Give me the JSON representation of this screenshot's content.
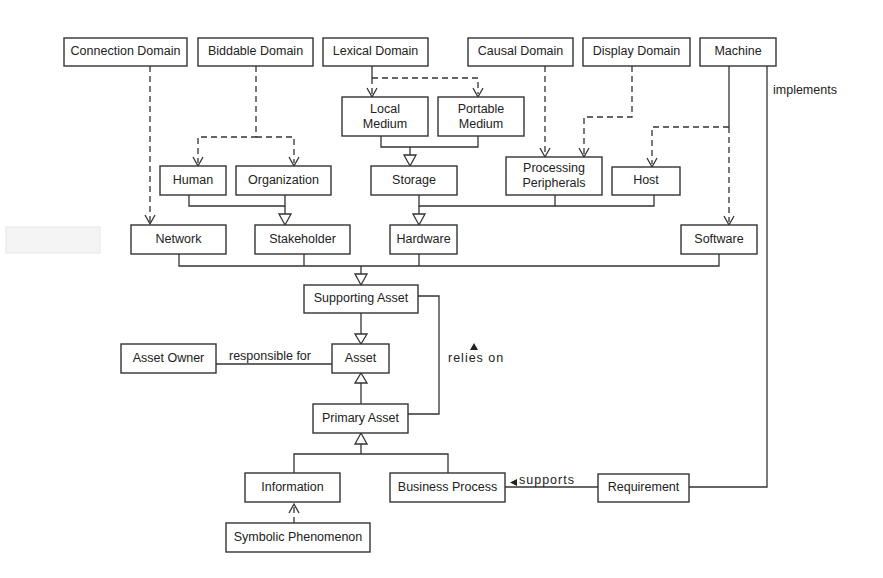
{
  "diagram": {
    "type": "class-diagram",
    "nodes": {
      "connection_domain": "Connection Domain",
      "biddable_domain": "Biddable Domain",
      "lexical_domain": "Lexical Domain",
      "causal_domain": "Causal Domain",
      "display_domain": "Display Domain",
      "machine": "Machine",
      "local_medium_1": "Local",
      "local_medium_2": "Medium",
      "portable_medium_1": "Portable",
      "portable_medium_2": "Medium",
      "human": "Human",
      "organization": "Organization",
      "storage": "Storage",
      "processing_peripherals_1": "Processing",
      "processing_peripherals_2": "Peripherals",
      "host": "Host",
      "network": "Network",
      "stakeholder": "Stakeholder",
      "hardware": "Hardware",
      "software": "Software",
      "supporting_asset": "Supporting Asset",
      "asset_owner": "Asset Owner",
      "asset": "Asset",
      "primary_asset": "Primary Asset",
      "information": "Information",
      "business_process": "Business Process",
      "requirement": "Requirement",
      "symbolic_phenomenon": "Symbolic Phenomenon"
    },
    "edge_labels": {
      "implements": "implements",
      "responsible_for": "responsible for",
      "relies_on": "relies on",
      "supports": "supports"
    },
    "edges": [
      {
        "from": "Connection Domain",
        "to": "Network",
        "kind": "dependency"
      },
      {
        "from": "Biddable Domain",
        "to": "Human",
        "kind": "dependency"
      },
      {
        "from": "Biddable Domain",
        "to": "Organization",
        "kind": "dependency"
      },
      {
        "from": "Lexical Domain",
        "to": "Local Medium",
        "kind": "dependency"
      },
      {
        "from": "Lexical Domain",
        "to": "Portable Medium",
        "kind": "dependency"
      },
      {
        "from": "Causal Domain",
        "to": "Processing Peripherals",
        "kind": "dependency"
      },
      {
        "from": "Display Domain",
        "to": "Processing Peripherals",
        "kind": "dependency"
      },
      {
        "from": "Machine",
        "to": "Host",
        "kind": "dependency"
      },
      {
        "from": "Machine",
        "to": "Software",
        "kind": "dependency"
      },
      {
        "from": "Machine",
        "to": "Requirement",
        "kind": "association",
        "label": "implements"
      },
      {
        "from": "Local Medium",
        "to": "Storage",
        "kind": "generalization"
      },
      {
        "from": "Portable Medium",
        "to": "Storage",
        "kind": "generalization"
      },
      {
        "from": "Human",
        "to": "Stakeholder",
        "kind": "generalization"
      },
      {
        "from": "Organization",
        "to": "Stakeholder",
        "kind": "generalization"
      },
      {
        "from": "Storage",
        "to": "Hardware",
        "kind": "generalization"
      },
      {
        "from": "Processing Peripherals",
        "to": "Hardware",
        "kind": "generalization"
      },
      {
        "from": "Host",
        "to": "Hardware",
        "kind": "generalization"
      },
      {
        "from": "Network",
        "to": "Supporting Asset",
        "kind": "generalization"
      },
      {
        "from": "Stakeholder",
        "to": "Supporting Asset",
        "kind": "generalization"
      },
      {
        "from": "Hardware",
        "to": "Supporting Asset",
        "kind": "generalization"
      },
      {
        "from": "Software",
        "to": "Supporting Asset",
        "kind": "generalization"
      },
      {
        "from": "Supporting Asset",
        "to": "Asset",
        "kind": "generalization"
      },
      {
        "from": "Primary Asset",
        "to": "Asset",
        "kind": "generalization"
      },
      {
        "from": "Asset Owner",
        "to": "Asset",
        "kind": "association",
        "label": "responsible for"
      },
      {
        "from": "Primary Asset",
        "to": "Supporting Asset",
        "kind": "association",
        "label": "relies on"
      },
      {
        "from": "Information",
        "to": "Primary Asset",
        "kind": "generalization"
      },
      {
        "from": "Business Process",
        "to": "Primary Asset",
        "kind": "generalization"
      },
      {
        "from": "Requirement",
        "to": "Business Process",
        "kind": "association",
        "label": "supports"
      },
      {
        "from": "Symbolic Phenomenon",
        "to": "Information",
        "kind": "dependency"
      }
    ]
  }
}
